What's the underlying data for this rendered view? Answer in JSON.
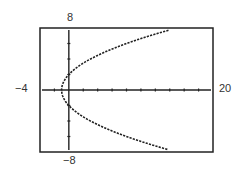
{
  "chart_data": {
    "type": "line",
    "title": "",
    "xlabel": "",
    "ylabel": "",
    "xlim": [
      -4,
      20
    ],
    "ylim": [
      -8,
      8
    ],
    "x_tick_step": 2,
    "y_tick_step": 2,
    "grid": false,
    "window_labels": {
      "xmin": "−4",
      "xmax": "20",
      "ymin": "−8",
      "ymax": "8"
    },
    "series": [
      {
        "name": "x = y²/4 − 1",
        "relation": "x = y^2/4 - 1",
        "points": [
          {
            "x": 15.0,
            "y": 8
          },
          {
            "x": 11.25,
            "y": 7
          },
          {
            "x": 8.0,
            "y": 6
          },
          {
            "x": 5.25,
            "y": 5
          },
          {
            "x": 3.0,
            "y": 4
          },
          {
            "x": 1.25,
            "y": 3
          },
          {
            "x": 0.0,
            "y": 2
          },
          {
            "x": -0.75,
            "y": 1
          },
          {
            "x": -1.0,
            "y": 0
          },
          {
            "x": -0.75,
            "y": -1
          },
          {
            "x": 0.0,
            "y": -2
          },
          {
            "x": 1.25,
            "y": -3
          },
          {
            "x": 3.0,
            "y": -4
          },
          {
            "x": 5.25,
            "y": -5
          },
          {
            "x": 8.0,
            "y": -6
          },
          {
            "x": 11.25,
            "y": -7
          },
          {
            "x": 15.0,
            "y": -8
          }
        ]
      }
    ]
  },
  "colors": {
    "frame": "#222222",
    "curve": "#222222",
    "text": "#333333"
  }
}
